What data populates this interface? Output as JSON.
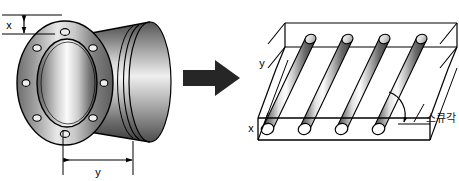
{
  "figure": {
    "background_color": "#ffffff",
    "line_color": "#000000",
    "arrow_color": "#262626"
  },
  "left_part": {
    "name": "flanged-cylindrical-sleeve",
    "bolt_hole_count": 8,
    "dimensions": [
      {
        "id": "x",
        "label": "x",
        "orientation": "vertical",
        "meaning": "flange-thickness"
      },
      {
        "id": "y",
        "label": "y",
        "orientation": "horizontal",
        "meaning": "sleeve-length"
      }
    ],
    "shading": {
      "flange_face_light": "#f2f2f2",
      "flange_face_dark": "#5a5a5a",
      "bore_light": "#ffffff",
      "bore_dark": "#4a4a4a",
      "body_light": "#ededed",
      "body_dark": "#3f3f3f"
    }
  },
  "transform_arrow": {
    "name": "transform-arrow",
    "direction": "right",
    "color": "#262626"
  },
  "right_part": {
    "name": "unrolled-skewed-rod-array",
    "rod_count": 4,
    "axis_labels": [
      {
        "id": "y",
        "label": "y",
        "position": "left-edge"
      },
      {
        "id": "x",
        "label": "x",
        "position": "bottom-left"
      }
    ],
    "annotation": {
      "label": "스큐각",
      "meaning": "skew-angle",
      "marker": "angle-arc-with-arrow"
    },
    "shading": {
      "rod_light": "#ffffff",
      "rod_mid": "#9a9a9a",
      "rod_dark": "#3c3c3c",
      "box_fill": "#ffffff"
    }
  }
}
